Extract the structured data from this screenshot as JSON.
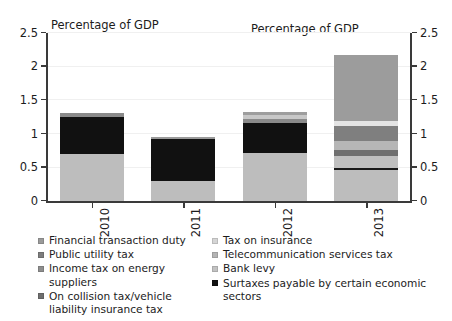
{
  "chart_data": {
    "type": "bar",
    "stacked": true,
    "title": "",
    "xlabel": "",
    "ylabel": "Percentage of GDP",
    "ylabel_right": "Percentage of GDP",
    "ylim": [
      0,
      2.5
    ],
    "yticks": [
      "0",
      "0.5",
      "1",
      "1.5",
      "2",
      "2.5"
    ],
    "ytick_values": [
      0,
      0.5,
      1,
      1.5,
      2,
      2.5
    ],
    "right_yticks": [
      "0",
      "0.5",
      "1",
      "1.5",
      "2",
      "2.5"
    ],
    "grid": true,
    "grid_axis": "y",
    "legend_position": "bottom",
    "categories": [
      "2010",
      "2011",
      "2012",
      "2013"
    ],
    "series": [
      {
        "name": "Financial transaction duty",
        "color": "#9a9a9a",
        "values": [
          0.0,
          0.0,
          0.0,
          0.0
        ]
      },
      {
        "name": "Tax on insurance",
        "color": "#c6c6c6",
        "values": [
          0.0,
          0.0,
          0.0,
          0.0
        ]
      },
      {
        "name": "Public utility tax",
        "color": "#7d7d7d",
        "values": [
          0.0,
          0.0,
          0.0,
          0.0
        ]
      },
      {
        "name": "Telecommunication services tax",
        "color": "#b4b4b4",
        "values": [
          0.0,
          0.0,
          0.0,
          0.0
        ]
      },
      {
        "name": "Income tax on energy suppliers",
        "color": "#8e8e8e",
        "values": [
          0.0,
          0.0,
          0.0,
          0.0
        ]
      },
      {
        "name": "Bank levy",
        "color": "#bdbdbd",
        "values": [
          0.7,
          0.3,
          0.72,
          0.46
        ]
      },
      {
        "name": "On collision tax/vehicle liability insurance tax",
        "color": "#6e6e6e",
        "values": [
          0.0,
          0.0,
          0.0,
          0.0
        ]
      },
      {
        "name": "Surtaxes payable by certain economic sectors",
        "color": "#111111",
        "values": [
          0.57,
          0.65,
          0.48,
          0.04
        ]
      }
    ],
    "bars": [
      {
        "category": "2010",
        "total": 1.31,
        "segments": [
          {
            "label": "Surtaxes payable by certain economic sectors",
            "value": 0.7,
            "color": "#bdbdbd"
          },
          {
            "label": "Bank levy",
            "value": 0.55,
            "color": "#111111"
          },
          {
            "label": "Telecommunication services tax",
            "value": 0.06,
            "color": "#8a8a8a"
          }
        ]
      },
      {
        "category": "2011",
        "total": 0.95,
        "segments": [
          {
            "label": "Surtaxes payable by certain economic sectors",
            "value": 0.3,
            "color": "#bdbdbd"
          },
          {
            "label": "Bank levy",
            "value": 0.63,
            "color": "#111111"
          },
          {
            "label": "Telecommunication services tax",
            "value": 0.02,
            "color": "#9a9a9a"
          }
        ]
      },
      {
        "category": "2012",
        "total": 1.33,
        "segments": [
          {
            "label": "Surtaxes payable by certain economic sectors",
            "value": 0.72,
            "color": "#bdbdbd"
          },
          {
            "label": "Bank levy",
            "value": 0.44,
            "color": "#111111"
          },
          {
            "label": "Telecommunication services tax",
            "value": 0.07,
            "color": "#8a8a8a"
          },
          {
            "label": "Tax on insurance",
            "value": 0.05,
            "color": "#c8c8c8"
          },
          {
            "label": "Financial transaction duty",
            "value": 0.05,
            "color": "#9e9e9e"
          }
        ]
      },
      {
        "category": "2013",
        "total": 2.17,
        "segments": [
          {
            "label": "Surtaxes payable by certain economic sectors",
            "value": 0.46,
            "color": "#bdbdbd"
          },
          {
            "label": "On collision tax/vehicle liability insurance tax",
            "value": 0.04,
            "color": "#1a1a1a"
          },
          {
            "label": "Income tax on energy suppliers",
            "value": 0.17,
            "color": "#c0c0c0"
          },
          {
            "label": "Bank levy",
            "value": 0.1,
            "color": "#707070"
          },
          {
            "label": "Telecommunication services tax",
            "value": 0.13,
            "color": "#b6b6b6"
          },
          {
            "label": "Public utility tax",
            "value": 0.22,
            "color": "#7f7f7f"
          },
          {
            "label": "Tax on insurance",
            "value": 0.08,
            "color": "#e4e4e4"
          },
          {
            "label": "Financial transaction duty",
            "value": 0.97,
            "color": "#9c9c9c"
          }
        ]
      }
    ]
  },
  "legend": {
    "column_left": [
      {
        "label": "Financial transaction duty",
        "color": "#9a9a9a"
      },
      {
        "label": "Public utility tax",
        "color": "#7d7d7d"
      },
      {
        "label": "Income tax on energy suppliers",
        "color": "#8e8e8e"
      },
      {
        "label": "On collision tax/vehicle liability insurance tax",
        "color": "#6e6e6e"
      }
    ],
    "column_right": [
      {
        "label": "Tax on insurance",
        "color": "#d5d5d5"
      },
      {
        "label": "Telecommunication services tax",
        "color": "#b4b4b4"
      },
      {
        "label": "Bank levy",
        "color": "#c2c2c2"
      },
      {
        "label": "Surtaxes payable by certain economic sectors",
        "color": "#111111"
      }
    ]
  },
  "colors": {
    "axis": "#3a3a3a",
    "grid": "#f0f0f0",
    "text": "#1c1c1c",
    "background": "#ffffff"
  }
}
